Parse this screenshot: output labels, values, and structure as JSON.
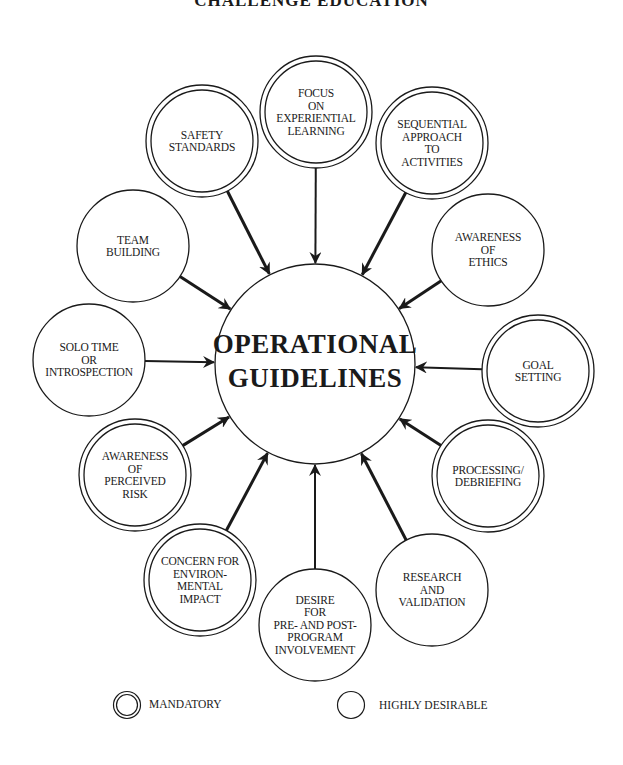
{
  "title": "CHALLENGE EDUCATION",
  "center": {
    "line1": "OPERATIONAL",
    "line2": "GUIDELINES",
    "cx": 315,
    "cy": 364,
    "r": 100
  },
  "nodes": [
    {
      "id": "focus",
      "lines": [
        "FOCUS",
        "ON",
        "EXPERIENTIAL",
        "LEARNING"
      ],
      "type": "mandatory",
      "cx": 316,
      "cy": 112
    },
    {
      "id": "sequential",
      "lines": [
        "SEQUENTIAL",
        "APPROACH",
        "TO",
        "ACTIVITIES"
      ],
      "type": "mandatory",
      "cx": 432,
      "cy": 143
    },
    {
      "id": "ethics",
      "lines": [
        "AWARENESS",
        "OF",
        "ETHICS"
      ],
      "type": "desirable",
      "cx": 488,
      "cy": 250
    },
    {
      "id": "goal",
      "lines": [
        "GOAL",
        "SETTING"
      ],
      "type": "mandatory",
      "cx": 538,
      "cy": 371
    },
    {
      "id": "processing",
      "lines": [
        "PROCESSING/",
        "DEBRIEFING"
      ],
      "type": "mandatory",
      "cx": 488,
      "cy": 476
    },
    {
      "id": "research",
      "lines": [
        "RESEARCH",
        "AND",
        "VALIDATION"
      ],
      "type": "desirable",
      "cx": 432,
      "cy": 590
    },
    {
      "id": "desire",
      "lines": [
        "DESIRE",
        "FOR",
        "PRE- AND POST-",
        "PROGRAM",
        "INVOLVEMENT"
      ],
      "type": "desirable",
      "cx": 315,
      "cy": 625
    },
    {
      "id": "concern",
      "lines": [
        "CONCERN FOR",
        "ENVIRON-",
        "MENTAL",
        "IMPACT"
      ],
      "type": "mandatory",
      "cx": 200,
      "cy": 580
    },
    {
      "id": "perceived-risk",
      "lines": [
        "AWARENESS",
        "OF",
        "PERCEIVED",
        "RISK"
      ],
      "type": "mandatory",
      "cx": 135,
      "cy": 475
    },
    {
      "id": "solo",
      "lines": [
        "SOLO TIME",
        "OR",
        "INTROSPECTION"
      ],
      "type": "desirable",
      "cx": 89,
      "cy": 360
    },
    {
      "id": "team",
      "lines": [
        "TEAM",
        "BUILDING"
      ],
      "type": "desirable",
      "cx": 133,
      "cy": 246
    },
    {
      "id": "safety",
      "lines": [
        "SAFETY",
        "STANDARDS"
      ],
      "type": "mandatory",
      "cx": 202,
      "cy": 141
    }
  ],
  "node_radius": 56,
  "legend": {
    "mandatory": {
      "label": "MANDATORY",
      "icon": "double-circle-icon"
    },
    "desirable": {
      "label": "HIGHLY DESIRABLE",
      "icon": "single-circle-icon"
    }
  },
  "colors": {
    "stroke": "#1a1a1a",
    "background": "#ffffff"
  }
}
